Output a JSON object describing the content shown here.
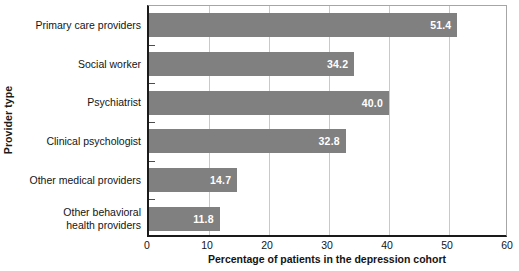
{
  "chart_data": {
    "type": "bar",
    "orientation": "horizontal",
    "title": "",
    "xlabel": "Percentage of patients in the depression cohort",
    "ylabel": "Provider type",
    "categories": [
      "Primary care providers",
      "Social worker",
      "Psychiatrist",
      "Clinical psychologist",
      "Other medical providers",
      "Other behavioral\nhealth providers"
    ],
    "values": [
      51.4,
      34.2,
      40.0,
      32.8,
      14.7,
      11.8
    ],
    "value_labels": [
      "51.4",
      "34.2",
      "40.0",
      "32.8",
      "14.7",
      "11.8"
    ],
    "xlim": [
      0,
      60
    ],
    "xticks": [
      0,
      10,
      20,
      30,
      40,
      50,
      60
    ],
    "xtick_labels": [
      "0",
      "10",
      "20",
      "30",
      "40",
      "50",
      "60"
    ],
    "grid": true,
    "grid_axis": "x",
    "legend": false,
    "bar_color": "#808080",
    "value_label_color": "#ffffff",
    "gridline_color": "#c9c9c9",
    "axis_color": "#1a1a1a",
    "plot_border_color": "#a6a6a6",
    "background": "#ffffff"
  }
}
